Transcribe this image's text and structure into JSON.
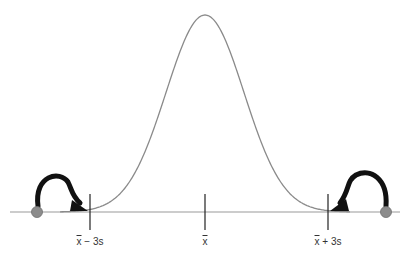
{
  "diagram": {
    "colors": {
      "curve": "#8a8a8a",
      "baseline": "#9a9a9a",
      "tick": "#222222",
      "arrow": "#111111",
      "dot": "#8c8c8c"
    },
    "ticks": [
      {
        "id": "minus3s",
        "x": 90,
        "label_symbol": "x",
        "label_rest": " − 3s"
      },
      {
        "id": "mean",
        "x": 205,
        "label_symbol": "x",
        "label_rest": ""
      },
      {
        "id": "plus3s",
        "x": 328,
        "label_symbol": "x",
        "label_rest": " + 3s"
      }
    ],
    "outliers": [
      {
        "side": "left",
        "x": 37,
        "y": 212
      },
      {
        "side": "right",
        "x": 386,
        "y": 212
      }
    ]
  }
}
